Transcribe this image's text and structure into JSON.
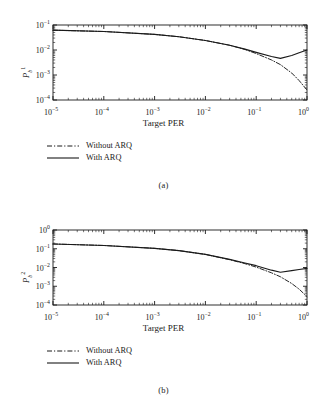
{
  "figure": {
    "background": "#ffffff",
    "line_color": "#1a1a1a"
  },
  "panels": [
    {
      "caption": "(a)",
      "ylabel_base": "P",
      "ylabel_sub": "b",
      "ylabel_sup": "1",
      "xlabel": "Target PER",
      "xticks": [
        "10-5",
        "10-4",
        "10-3",
        "10-2",
        "10-1",
        "100"
      ],
      "xtick_mant": [
        "10",
        "10",
        "10",
        "10",
        "10",
        "10"
      ],
      "xtick_exp": [
        "−5",
        "−4",
        "−3",
        "−2",
        "−1",
        "0"
      ],
      "ytick_mant": [
        "10",
        "10",
        "10",
        "10"
      ],
      "ytick_exp": [
        "−1",
        "−2",
        "−3",
        "−4"
      ],
      "legend": [
        {
          "label": "Without ARQ",
          "style": "dashdot"
        },
        {
          "label": "With ARQ",
          "style": "solid"
        }
      ]
    },
    {
      "caption": "(b)",
      "ylabel_base": "P",
      "ylabel_sub": "b",
      "ylabel_sup": "2",
      "xlabel": "Target PER",
      "xtick_mant": [
        "10",
        "10",
        "10",
        "10",
        "10",
        "10"
      ],
      "xtick_exp": [
        "−5",
        "−4",
        "−3",
        "−2",
        "−1",
        "0"
      ],
      "ytick_mant": [
        "10",
        "10",
        "10",
        "10",
        "10"
      ],
      "ytick_exp": [
        "0",
        "−1",
        "−2",
        "−3",
        "−4"
      ],
      "legend": [
        {
          "label": "Without ARQ",
          "style": "dashdot"
        },
        {
          "label": "With ARQ",
          "style": "solid"
        }
      ]
    }
  ],
  "chart_data": [
    {
      "type": "line",
      "title": "",
      "xlabel": "Target PER",
      "ylabel": "P_b^1",
      "xscale": "log",
      "yscale": "log",
      "xlim": [
        1e-05,
        1
      ],
      "ylim": [
        0.0001,
        0.1
      ],
      "grid": false,
      "legend_position": "below-axes-left",
      "series": [
        {
          "name": "Without ARQ",
          "style": "dash-dot",
          "x": [
            1e-05,
            0.0001,
            0.001,
            0.003,
            0.01,
            0.03,
            0.06,
            0.1,
            0.2,
            0.3,
            0.5,
            0.7,
            1.0
          ],
          "y": [
            0.062,
            0.055,
            0.042,
            0.034,
            0.024,
            0.0155,
            0.0105,
            0.0072,
            0.004,
            0.0026,
            0.0012,
            0.0006,
            0.00025
          ]
        },
        {
          "name": "With ARQ",
          "style": "solid",
          "x": [
            1e-05,
            0.0001,
            0.001,
            0.003,
            0.01,
            0.03,
            0.06,
            0.1,
            0.2,
            0.3,
            0.5,
            0.7,
            1.0
          ],
          "y": [
            0.062,
            0.055,
            0.042,
            0.034,
            0.024,
            0.0155,
            0.0108,
            0.008,
            0.0055,
            0.0046,
            0.006,
            0.0078,
            0.01
          ]
        }
      ]
    },
    {
      "type": "line",
      "title": "",
      "xlabel": "Target PER",
      "ylabel": "P_b^2",
      "xscale": "log",
      "yscale": "log",
      "xlim": [
        1e-05,
        1
      ],
      "ylim": [
        0.0001,
        1.0
      ],
      "grid": false,
      "legend_position": "below-axes-left",
      "series": [
        {
          "name": "Without ARQ",
          "style": "dash-dot",
          "x": [
            1e-05,
            0.0001,
            0.001,
            0.003,
            0.01,
            0.03,
            0.06,
            0.1,
            0.2,
            0.3,
            0.5,
            0.7,
            1.0
          ],
          "y": [
            0.18,
            0.15,
            0.105,
            0.08,
            0.05,
            0.026,
            0.016,
            0.0105,
            0.0052,
            0.0032,
            0.0014,
            0.0007,
            0.00028
          ]
        },
        {
          "name": "With ARQ",
          "style": "solid",
          "x": [
            1e-05,
            0.0001,
            0.001,
            0.003,
            0.01,
            0.03,
            0.06,
            0.1,
            0.2,
            0.3,
            0.5,
            0.7,
            1.0
          ],
          "y": [
            0.18,
            0.15,
            0.105,
            0.08,
            0.05,
            0.027,
            0.0175,
            0.0125,
            0.0072,
            0.0056,
            0.0068,
            0.0078,
            0.009
          ]
        }
      ]
    }
  ]
}
